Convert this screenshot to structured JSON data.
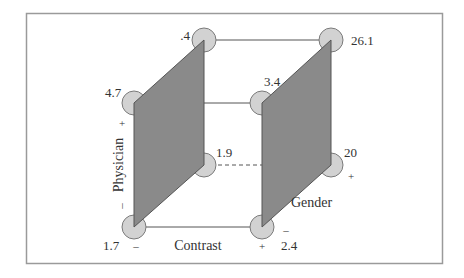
{
  "colors": {
    "panel_fill": "#8a8a8a",
    "panel_stroke": "#555555",
    "node_fill": "#d2d2d2",
    "node_stroke": "#7a7a7a",
    "edge": "#555555",
    "frame": "#9a9a9a"
  },
  "factors": {
    "physician": {
      "label": "Physician",
      "minus": "–",
      "plus": "+"
    },
    "contrast": {
      "label": "Contrast",
      "minus": "–",
      "plus": "+"
    },
    "gender": {
      "label": "Gender",
      "minus": "–",
      "plus": "+"
    }
  },
  "nodes": [
    {
      "id": "back-top-left",
      "value": ".4"
    },
    {
      "id": "back-top-right",
      "value": "26.1"
    },
    {
      "id": "front-top-left",
      "value": "4.7"
    },
    {
      "id": "front-top-right",
      "value": "3.4"
    },
    {
      "id": "back-bottom-left",
      "value": "1.9"
    },
    {
      "id": "back-bottom-right",
      "value": "20"
    },
    {
      "id": "front-bottom-left",
      "value": "1.7"
    },
    {
      "id": "front-bottom-right",
      "value": "2.4"
    }
  ]
}
